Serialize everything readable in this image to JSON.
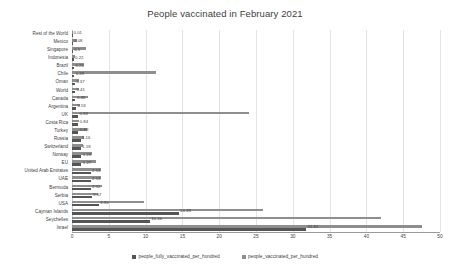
{
  "chart_data": {
    "type": "bar",
    "orientation": "horizontal",
    "title": "People vaccinated in February 2021",
    "xlabel": "",
    "ylabel": "",
    "xlim": [
      0,
      50
    ],
    "xticks": [
      0,
      5,
      10,
      15,
      20,
      25,
      30,
      35,
      40,
      45,
      50
    ],
    "grid": true,
    "legend_position": "bottom",
    "categories": [
      "Rest of the World",
      "Mexico",
      "Singapore",
      "Indonesia",
      "Brazil",
      "Chile",
      "Oman",
      "World",
      "Canada",
      "Argentina",
      "UK",
      "Costa Rica",
      "Turkey",
      "Russia",
      "Switzerland",
      "Norway",
      "EU",
      "United Arab Emirates",
      "UAE",
      "Bermuda",
      "Serbia",
      "USA",
      "Cayman Islands",
      "Seychelles",
      "Israel"
    ],
    "series": [
      {
        "name": "people_fully_vaccinated_per_hundred",
        "color": "#555555",
        "labels_shown": true,
        "values": [
          0.01,
          0.08,
          0.1,
          0.22,
          0.26,
          0.29,
          0.37,
          0.41,
          0.46,
          0.53,
          0.83,
          0.84,
          0.88,
          1.16,
          1.18,
          1.26,
          1.27,
          2.53,
          2.53,
          2.52,
          2.67,
          3.65,
          14.48,
          10.56,
          31.81
        ],
        "value_labels": [
          "0.01",
          "0.08",
          "0.1",
          "0.22",
          "0.26",
          "0.29",
          "0.37",
          "0.41",
          "0.46",
          "0.53",
          "0.83",
          "0.84",
          "0.88",
          "1.16",
          "1.18",
          "1.26",
          "1.27",
          "2.53",
          "2.53",
          "2.52",
          "2.67",
          "3.65",
          "14.48",
          "10.56",
          "31.81"
        ]
      },
      {
        "name": "people_vaccinated_per_hundred",
        "color": "#8e8e8e",
        "labels_shown": false,
        "values": [
          0.02,
          0.62,
          1.95,
          0.35,
          1.65,
          11.4,
          0.9,
          0.95,
          2.2,
          1.05,
          24.0,
          1.0,
          2.05,
          1.6,
          1.55,
          2.7,
          3.25,
          4.0,
          4.0,
          4.1,
          3.6,
          9.8,
          26.0,
          42.0,
          47.5
        ]
      }
    ],
    "legend": [
      "people_fully_vaccinated_per_hundred",
      "people_vaccinated_per_hundred"
    ]
  }
}
